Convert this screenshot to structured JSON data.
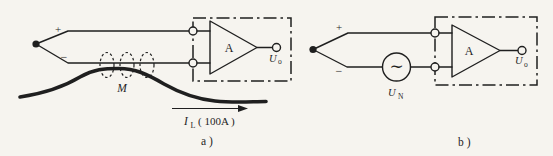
{
  "figure": {
    "background_color": "#f6f4ef",
    "ink_color": "#1f1f1f"
  },
  "circuit_a": {
    "caption": "a )",
    "plus_label": "+",
    "minus_label": "−",
    "amplifier_label": "A",
    "output_label_main": "U",
    "output_label_sub": "o",
    "mutual_inductance_label": "M",
    "current_label_main": "I",
    "current_label_sub": "L",
    "current_label_value": "( 100A )"
  },
  "circuit_b": {
    "caption": "b )",
    "plus_label": "+",
    "minus_label": "−",
    "amplifier_label": "A",
    "output_label_main": "U",
    "output_label_sub": "o",
    "noise_source_symbol": "∼",
    "noise_label_main": "U",
    "noise_label_sub": "N"
  }
}
